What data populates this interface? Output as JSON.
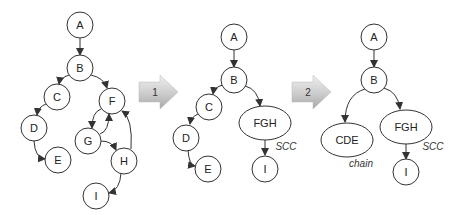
{
  "diagram": {
    "graph1": {
      "nodes": [
        {
          "id": "A",
          "label": "A"
        },
        {
          "id": "B",
          "label": "B"
        },
        {
          "id": "C",
          "label": "C"
        },
        {
          "id": "D",
          "label": "D"
        },
        {
          "id": "E",
          "label": "E"
        },
        {
          "id": "F",
          "label": "F"
        },
        {
          "id": "G",
          "label": "G"
        },
        {
          "id": "H",
          "label": "H"
        },
        {
          "id": "I",
          "label": "I"
        }
      ],
      "edges": [
        [
          "A",
          "B"
        ],
        [
          "B",
          "C"
        ],
        [
          "B",
          "F"
        ],
        [
          "C",
          "D"
        ],
        [
          "D",
          "E"
        ],
        [
          "F",
          "G"
        ],
        [
          "G",
          "F"
        ],
        [
          "G",
          "H"
        ],
        [
          "H",
          "F"
        ],
        [
          "H",
          "I"
        ]
      ]
    },
    "step1": {
      "label": "1"
    },
    "graph2": {
      "nodes": [
        {
          "id": "A",
          "label": "A"
        },
        {
          "id": "B",
          "label": "B"
        },
        {
          "id": "C",
          "label": "C"
        },
        {
          "id": "D",
          "label": "D"
        },
        {
          "id": "E",
          "label": "E"
        },
        {
          "id": "FGH",
          "label": "FGH"
        },
        {
          "id": "I",
          "label": "I"
        }
      ],
      "edges": [
        [
          "A",
          "B"
        ],
        [
          "B",
          "C"
        ],
        [
          "B",
          "FGH"
        ],
        [
          "C",
          "D"
        ],
        [
          "D",
          "E"
        ],
        [
          "FGH",
          "I"
        ]
      ],
      "annotation": "SCC"
    },
    "step2": {
      "label": "2"
    },
    "graph3": {
      "nodes": [
        {
          "id": "A",
          "label": "A"
        },
        {
          "id": "B",
          "label": "B"
        },
        {
          "id": "CDE",
          "label": "CDE"
        },
        {
          "id": "FGH",
          "label": "FGH"
        },
        {
          "id": "I",
          "label": "I"
        }
      ],
      "edges": [
        [
          "A",
          "B"
        ],
        [
          "B",
          "CDE"
        ],
        [
          "B",
          "FGH"
        ],
        [
          "FGH",
          "I"
        ]
      ],
      "annotations": {
        "cde": "chain",
        "fgh": "SCC"
      }
    },
    "colors": {
      "stroke": "#333333",
      "arrow_fill_light": "#e4e4e4",
      "arrow_fill_dark": "#b0b0b0"
    }
  }
}
